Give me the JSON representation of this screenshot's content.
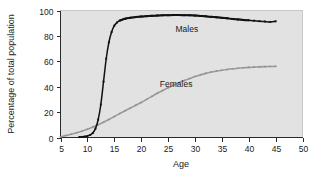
{
  "chart_data": {
    "type": "line",
    "title": "",
    "xlabel": "Age",
    "ylabel": "Percentage of total population",
    "xlim": [
      5,
      50
    ],
    "ylim": [
      0,
      100
    ],
    "xticks": [
      5,
      10,
      15,
      20,
      25,
      30,
      35,
      40,
      45,
      50
    ],
    "xtick_labels": [
      "5",
      "10",
      "15",
      "20",
      "25",
      "30",
      "35",
      "40",
      "45",
      "50"
    ],
    "yticks": [
      0,
      20,
      40,
      60,
      80,
      100
    ],
    "ytick_labels": [
      "0",
      "20",
      "40",
      "60",
      "80",
      "100"
    ],
    "grid": false,
    "legend_position": "inline-annotation",
    "plot_background": "#e2e2e2",
    "page_background": "#ffffff",
    "series": [
      {
        "name": "Males",
        "color": "#111111",
        "marker": "square",
        "label_x": 28.5,
        "label_y": 83,
        "x": [
          8.5,
          9.0,
          9.5,
          10.0,
          10.5,
          11.0,
          11.5,
          12.0,
          12.5,
          13.0,
          13.5,
          14.0,
          14.5,
          15.0,
          15.5,
          16.0,
          17.0,
          18.0,
          19.0,
          20.0,
          21.0,
          22.0,
          23.0,
          24.0,
          25.0,
          26.0,
          27.0,
          28.0,
          29.0,
          30.0,
          31.0,
          32.0,
          33.0,
          34.0,
          35.0,
          36.0,
          37.0,
          38.0,
          39.0,
          40.0,
          41.0,
          42.0,
          43.0,
          44.0,
          45.0
        ],
        "y": [
          0.3,
          0.5,
          0.8,
          1.2,
          2.0,
          3.5,
          7.0,
          14.0,
          26.0,
          44.0,
          62.0,
          75.0,
          83.0,
          88.0,
          90.5,
          92.0,
          93.5,
          94.3,
          94.8,
          95.2,
          95.5,
          95.8,
          96.0,
          96.2,
          96.3,
          96.4,
          96.4,
          96.3,
          96.2,
          96.0,
          95.7,
          95.4,
          95.0,
          94.6,
          94.2,
          93.8,
          93.4,
          93.0,
          92.6,
          92.3,
          92.0,
          91.6,
          91.3,
          91.0,
          91.5
        ]
      },
      {
        "name": "Females",
        "color": "#9a9a9a",
        "marker": "square",
        "label_x": 26.5,
        "label_y": 40,
        "x": [
          5.0,
          6.0,
          7.0,
          8.0,
          9.0,
          10.0,
          11.0,
          12.0,
          13.0,
          14.0,
          15.0,
          16.0,
          17.0,
          18.0,
          19.0,
          20.0,
          21.0,
          22.0,
          23.0,
          24.0,
          25.0,
          26.0,
          27.0,
          28.0,
          29.0,
          30.0,
          31.0,
          32.0,
          33.0,
          34.0,
          35.0,
          36.0,
          37.0,
          38.0,
          39.0,
          40.0,
          41.0,
          42.0,
          43.0,
          44.0,
          45.0
        ],
        "y": [
          0.5,
          1.5,
          2.6,
          3.8,
          5.0,
          6.5,
          8.2,
          10.0,
          12.0,
          14.2,
          16.5,
          18.8,
          21.0,
          23.2,
          25.4,
          27.6,
          30.0,
          32.4,
          34.8,
          37.0,
          39.2,
          41.2,
          43.0,
          44.8,
          46.4,
          48.0,
          49.3,
          50.5,
          51.5,
          52.3,
          53.0,
          53.6,
          54.1,
          54.5,
          54.9,
          55.2,
          55.4,
          55.6,
          55.8,
          55.9,
          56.0
        ]
      }
    ],
    "annotations": [
      {
        "text": "Males",
        "x": 28.5,
        "y": 83
      },
      {
        "text": "Females",
        "x": 26.5,
        "y": 40
      }
    ],
    "males_overlay_line": {
      "description": "solid connecting line drawn over male markers",
      "x_start": 16.0,
      "x_end": 40.0
    }
  }
}
